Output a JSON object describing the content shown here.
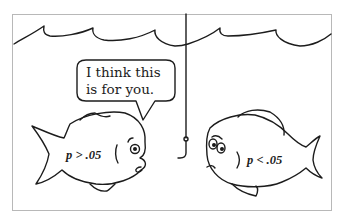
{
  "cartoon": {
    "speech_bubble": {
      "text": "I think this\nis for you."
    },
    "fish_left": {
      "label": "p > .05"
    },
    "fish_right": {
      "label": "p < .05"
    },
    "colors": {
      "ink": "#1c1c1c",
      "frame": "#b8b8b8",
      "background": "#ffffff"
    }
  }
}
